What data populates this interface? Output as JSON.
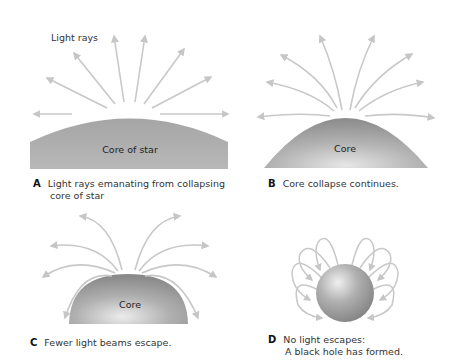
{
  "panels": {
    "a": {
      "letter": "A",
      "caption_line1": "Light rays emanating from collapsing",
      "caption_line2": "core of star",
      "core_label": "Core of star",
      "annotation": "Light rays"
    },
    "b": {
      "letter": "B",
      "caption_line1": "Core collapse continues.",
      "core_label": "Core"
    },
    "c": {
      "letter": "C",
      "caption_line1": "Fewer light beams escape.",
      "core_label": "Core"
    },
    "d": {
      "letter": "D",
      "caption_line1": "No light escapes:",
      "caption_line2": "A black hole has formed."
    }
  },
  "colors": {
    "ray": "#c8c8c8",
    "core_light": "#d8d8d8",
    "core_dark": "#8f8f8f"
  }
}
